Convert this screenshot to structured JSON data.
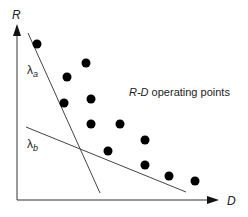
{
  "axes": {
    "y_label": "R",
    "x_label": "D"
  },
  "lines": [
    {
      "name": "lambda_a",
      "label": "λ",
      "subscript": "a",
      "x1": 28,
      "y1": 33,
      "x2": 100,
      "y2": 193
    },
    {
      "name": "lambda_b",
      "label": "λ",
      "subscript": "b",
      "x1": 26,
      "y1": 127,
      "x2": 186,
      "y2": 192
    }
  ],
  "annotation": {
    "prefix": "R-D",
    "suffix": " operating points"
  },
  "points": [
    [
      37,
      44
    ],
    [
      86,
      63
    ],
    [
      67,
      77
    ],
    [
      64,
      103
    ],
    [
      91,
      99
    ],
    [
      91,
      124
    ],
    [
      120,
      124
    ],
    [
      145,
      140
    ],
    [
      108,
      151
    ],
    [
      145,
      165
    ],
    [
      169,
      176
    ],
    [
      195,
      181
    ]
  ],
  "colors": {
    "axis": "#333333",
    "line": "#444444",
    "point": "#000000"
  }
}
